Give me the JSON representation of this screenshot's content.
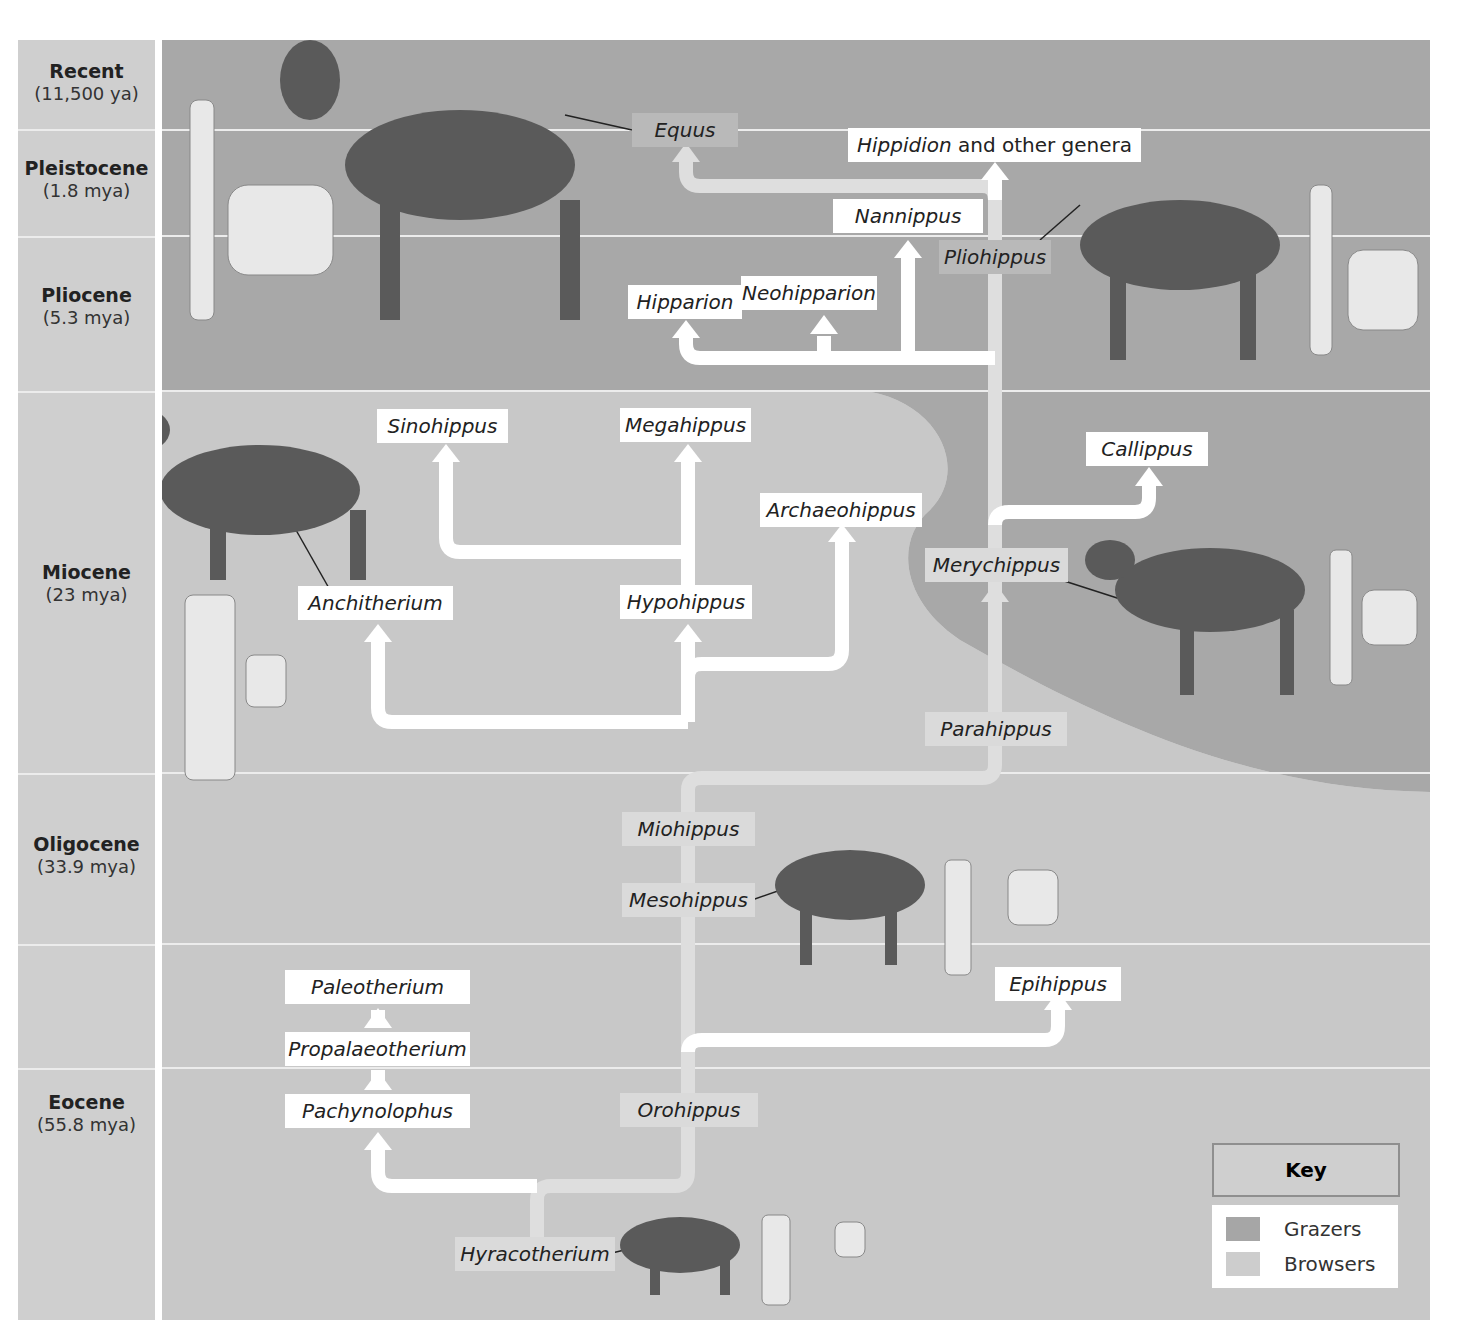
{
  "eras": [
    {
      "name": "Recent",
      "date": "(11,500 ya)"
    },
    {
      "name": "Pleistocene",
      "date": "(1.8 mya)"
    },
    {
      "name": "Pliocene",
      "date": "(5.3 mya)"
    },
    {
      "name": "Miocene",
      "date": "(23 mya)"
    },
    {
      "name": "Oligocene",
      "date": "(33.9 mya)"
    },
    {
      "name": "Eocene",
      "date": "(55.8 mya)"
    }
  ],
  "genera": {
    "equus": "Equus",
    "hippidion_italic": "Hippidion",
    "hippidion_rest": " and other genera",
    "nannippus": "Nannippus",
    "pliohippus": "Pliohippus",
    "hipparion": "Hipparion",
    "neohipparion": "Neohipparion",
    "sinohippus": "Sinohippus",
    "megahippus": "Megahippus",
    "callippus": "Callippus",
    "archaeohippus": "Archaeohippus",
    "merychippus": "Merychippus",
    "anchitherium": "Anchitherium",
    "hypohippus": "Hypohippus",
    "parahippus": "Parahippus",
    "miohippus": "Miohippus",
    "mesohippus": "Mesohippus",
    "paleotherium": "Paleotherium",
    "epihippus": "Epihippus",
    "propalaeotherium": "Propalaeotherium",
    "pachynolophus": "Pachynolophus",
    "orohippus": "Orohippus",
    "hyracotherium": "Hyracotherium"
  },
  "key": {
    "title": "Key",
    "items": [
      {
        "label": "Grazers",
        "color": "#a6a6a6"
      },
      {
        "label": "Browsers",
        "color": "#cdcdcd"
      }
    ]
  },
  "colors": {
    "grazer_bg": "#a8a8a8",
    "browser_bg": "#c8c8c8",
    "arrow_white": "#ffffff",
    "arrow_light": "#dedede"
  }
}
